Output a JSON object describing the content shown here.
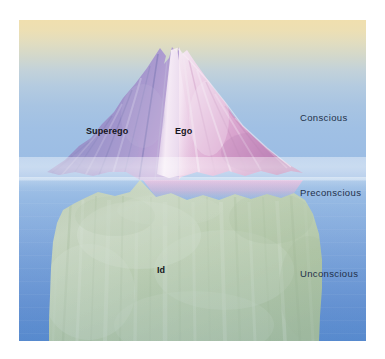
{
  "figure": {
    "type": "conceptual-diagram-photo"
  },
  "structure_labels": [
    {
      "key": "superego",
      "text": "Superego"
    },
    {
      "key": "ego",
      "text": "Ego"
    },
    {
      "key": "id",
      "text": "Id"
    }
  ],
  "layer_labels": [
    {
      "key": "conscious",
      "text": "Conscious"
    },
    {
      "key": "preconscious",
      "text": "Preconscious"
    },
    {
      "key": "unconscious",
      "text": "Unconscious"
    }
  ],
  "berg": {
    "superego_label": "Superego",
    "ego_label": "Ego",
    "id_label": "Id"
  },
  "layers": {
    "conscious_label": "Conscious",
    "preconscious_label": "Preconscious",
    "unconscious_label": "Unconscious"
  },
  "colors": {
    "sky_top": "#f0dfae",
    "sky_bottom": "#9cbde4",
    "sea_shallow": "#9ec0e6",
    "sea_deep": "#5286cc",
    "berg_left_face": "#8f8cc4",
    "berg_right_face": "#d9a6cf",
    "berg_highlight": "#f3e4f0",
    "berg_submerged": "#b9c9a6",
    "label_dark": "#151520",
    "layer_label": "#23304a",
    "page_background": "#ffffff"
  }
}
